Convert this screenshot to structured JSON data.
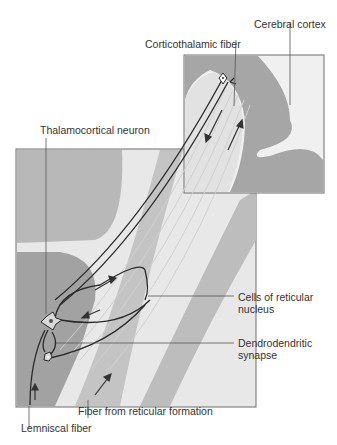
{
  "labels": {
    "cerebral_cortex": "Cerebral cortex",
    "corticothalamic_fiber": "Corticothalamic fiber",
    "thalamocortical_neuron": "Thalamocortical neuron",
    "cells_reticular_1": "Cells of reticular",
    "cells_reticular_2": "nucleus",
    "dendrodendritic_1": "Dendrodendritic",
    "dendrodendritic_2": "synapse",
    "fiber_reticular_formation": "Fiber from reticular formation",
    "lemniscal_fiber": "Lemniscal fiber"
  },
  "colors": {
    "dark_gray": "#8e8e8e",
    "mid_gray": "#b4b4b4",
    "light_gray": "#e6e6e6",
    "line": "#2a2a2a",
    "frame": "#6e6e6e"
  }
}
